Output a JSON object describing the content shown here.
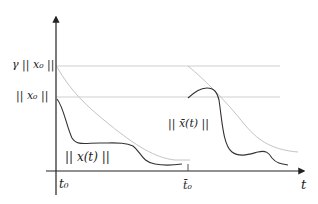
{
  "diagram": {
    "colors": {
      "axis": "#222222",
      "trajectory": "#333333",
      "envelope": "#c8c8c8",
      "reference_lines": "#cfcfcf"
    },
    "labels": {
      "gamma_x0": "γ || x₀ ||",
      "x0": "|| x₀ ||",
      "x_t": "|| x(t) ||",
      "xbar_t": "|| x̄(t) ||",
      "t0": "t₀",
      "t0_bar": "t̄₀",
      "t_axis": "t"
    },
    "axes": {
      "vertical": {
        "x": 56,
        "top": 15,
        "bottom": 195
      },
      "horizontal": {
        "y": 171,
        "left": 46,
        "right": 306
      }
    },
    "reference_lines": [
      {
        "name": "gamma-x0-line",
        "y": 66,
        "x1": 56,
        "x2": 280
      },
      {
        "name": "x0-line",
        "y": 97,
        "x1": 56,
        "x2": 280
      }
    ],
    "tick_t0_bar": {
      "x": 188,
      "y1": 163,
      "y2": 171
    }
  }
}
